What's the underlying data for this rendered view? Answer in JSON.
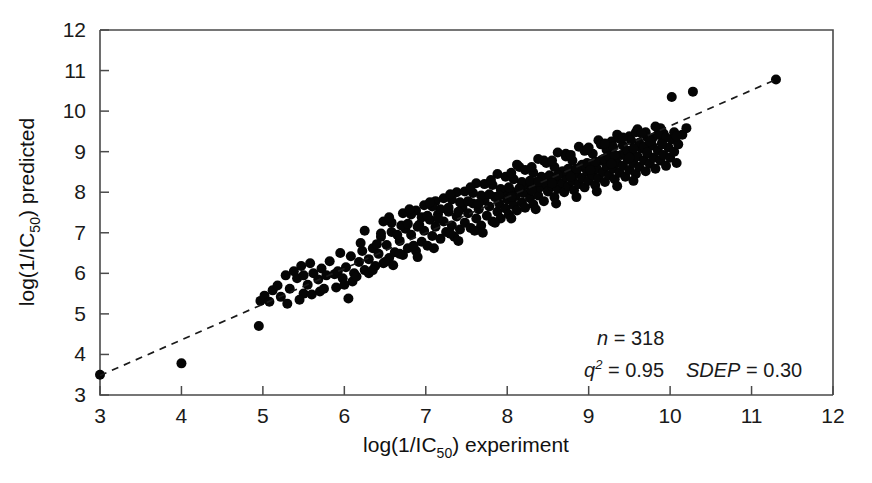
{
  "figure": {
    "background_color": "#ffffff",
    "marker_color": "#050505",
    "axis_color": "#4a4a4a",
    "line_color": "#1a1a1a"
  },
  "chart_data": {
    "type": "scatter",
    "title": "",
    "subtitle": "",
    "xlabel": "log(1/IC50) experiment",
    "ylabel": "log(1/IC50) predicted",
    "xlabel_parts": {
      "prefix": "log(1/IC",
      "subscript": "50",
      "suffix": ") experiment"
    },
    "ylabel_parts": {
      "prefix": "log(1/IC",
      "subscript": "50",
      "suffix": ") predicted"
    },
    "xlim": [
      3,
      12
    ],
    "ylim": [
      3,
      12
    ],
    "xticks": [
      3,
      4,
      5,
      6,
      7,
      8,
      9,
      10,
      11,
      12
    ],
    "yticks": [
      3,
      4,
      5,
      6,
      7,
      8,
      9,
      10,
      11,
      12
    ],
    "xtick_labels": [
      "3",
      "4",
      "5",
      "6",
      "7",
      "8",
      "9",
      "10",
      "11",
      "12"
    ],
    "ytick_labels": [
      "3",
      "4",
      "5",
      "6",
      "7",
      "8",
      "9",
      "10",
      "11",
      "12"
    ],
    "grid": false,
    "legend": null,
    "marker_style": "filled-circle",
    "marker_size_px": 10,
    "annotations": [
      {
        "name": "n",
        "label": "n",
        "operator": "=",
        "value": "318",
        "superscript": ""
      },
      {
        "name": "q2",
        "label": "q",
        "operator": "=",
        "value": "0.95",
        "superscript": "2"
      },
      {
        "name": "sdep",
        "label": "SDEP",
        "operator": "=",
        "value": "0.30",
        "superscript": ""
      }
    ],
    "fit_line": {
      "style": "dashed",
      "x": [
        3.0,
        11.3
      ],
      "y": [
        3.48,
        10.78
      ]
    },
    "n_points": 318,
    "points": [
      [
        3.0,
        3.5
      ],
      [
        4.0,
        3.78
      ],
      [
        4.95,
        4.7
      ],
      [
        4.97,
        5.32
      ],
      [
        5.02,
        5.45
      ],
      [
        5.08,
        5.3
      ],
      [
        5.12,
        5.58
      ],
      [
        5.18,
        5.7
      ],
      [
        5.22,
        5.42
      ],
      [
        5.28,
        5.95
      ],
      [
        5.33,
        5.62
      ],
      [
        5.38,
        6.05
      ],
      [
        5.42,
        5.88
      ],
      [
        5.47,
        6.18
      ],
      [
        5.5,
        5.95
      ],
      [
        5.55,
        5.72
      ],
      [
        5.58,
        6.25
      ],
      [
        5.62,
        6.0
      ],
      [
        5.68,
        5.85
      ],
      [
        5.72,
        6.12
      ],
      [
        5.78,
        5.95
      ],
      [
        5.82,
        6.3
      ],
      [
        5.88,
        5.98
      ],
      [
        5.92,
        6.05
      ],
      [
        5.98,
        5.88
      ],
      [
        6.02,
        6.15
      ],
      [
        6.05,
        5.38
      ],
      [
        6.08,
        6.42
      ],
      [
        6.12,
        6.0
      ],
      [
        6.18,
        6.28
      ],
      [
        6.22,
        6.55
      ],
      [
        6.25,
        6.08
      ],
      [
        6.3,
        6.35
      ],
      [
        6.35,
        6.62
      ],
      [
        6.38,
        6.18
      ],
      [
        6.42,
        6.48
      ],
      [
        6.45,
        6.9
      ],
      [
        6.48,
        6.25
      ],
      [
        6.52,
        6.7
      ],
      [
        6.55,
        6.38
      ],
      [
        6.58,
        7.02
      ],
      [
        6.62,
        6.52
      ],
      [
        6.68,
        6.8
      ],
      [
        6.72,
        6.45
      ],
      [
        6.75,
        7.1
      ],
      [
        6.78,
        6.62
      ],
      [
        6.82,
        6.95
      ],
      [
        6.88,
        6.55
      ],
      [
        6.92,
        7.2
      ],
      [
        6.95,
        6.78
      ],
      [
        6.98,
        7.05
      ],
      [
        7.02,
        6.68
      ],
      [
        7.05,
        7.32
      ],
      [
        7.08,
        6.92
      ],
      [
        7.12,
        7.15
      ],
      [
        7.15,
        7.45
      ],
      [
        7.18,
        6.85
      ],
      [
        7.22,
        7.28
      ],
      [
        7.25,
        7.02
      ],
      [
        7.28,
        7.52
      ],
      [
        7.32,
        7.18
      ],
      [
        7.35,
        6.9
      ],
      [
        7.38,
        7.4
      ],
      [
        7.42,
        7.08
      ],
      [
        7.45,
        7.62
      ],
      [
        7.48,
        7.25
      ],
      [
        7.52,
        7.48
      ],
      [
        7.55,
        7.12
      ],
      [
        7.58,
        7.72
      ],
      [
        7.62,
        7.35
      ],
      [
        7.65,
        7.58
      ],
      [
        7.68,
        7.18
      ],
      [
        7.72,
        7.8
      ],
      [
        7.75,
        7.42
      ],
      [
        7.78,
        7.65
      ],
      [
        7.82,
        7.28
      ],
      [
        7.85,
        7.88
      ],
      [
        7.88,
        7.52
      ],
      [
        7.9,
        7.72
      ],
      [
        7.92,
        7.35
      ],
      [
        7.95,
        7.95
      ],
      [
        7.98,
        7.6
      ],
      [
        8.0,
        7.82
      ],
      [
        8.02,
        7.45
      ],
      [
        8.05,
        8.02
      ],
      [
        8.08,
        7.68
      ],
      [
        8.1,
        7.9
      ],
      [
        8.12,
        7.55
      ],
      [
        8.15,
        8.1
      ],
      [
        8.18,
        7.75
      ],
      [
        8.2,
        7.98
      ],
      [
        8.22,
        7.62
      ],
      [
        8.25,
        8.18
      ],
      [
        8.28,
        7.85
      ],
      [
        8.3,
        8.05
      ],
      [
        8.32,
        7.7
      ],
      [
        8.35,
        8.25
      ],
      [
        8.38,
        7.92
      ],
      [
        8.4,
        8.12
      ],
      [
        8.42,
        8.32
      ],
      [
        8.45,
        7.78
      ],
      [
        8.48,
        8.2
      ],
      [
        8.5,
        8.02
      ],
      [
        8.52,
        8.4
      ],
      [
        8.55,
        8.15
      ],
      [
        8.58,
        7.88
      ],
      [
        8.6,
        8.3
      ],
      [
        8.62,
        8.08
      ],
      [
        8.65,
        8.48
      ],
      [
        8.68,
        8.22
      ],
      [
        8.7,
        8.0
      ],
      [
        8.72,
        8.38
      ],
      [
        8.75,
        8.15
      ],
      [
        8.78,
        8.55
      ],
      [
        8.8,
        8.28
      ],
      [
        8.82,
        8.05
      ],
      [
        8.85,
        8.45
      ],
      [
        8.88,
        8.2
      ],
      [
        8.9,
        8.62
      ],
      [
        8.92,
        8.35
      ],
      [
        8.95,
        8.12
      ],
      [
        8.98,
        8.52
      ],
      [
        9.0,
        8.28
      ],
      [
        9.02,
        8.7
      ],
      [
        9.05,
        8.42
      ],
      [
        9.08,
        8.18
      ],
      [
        9.1,
        8.58
      ],
      [
        9.12,
        8.35
      ],
      [
        9.15,
        8.78
      ],
      [
        9.18,
        8.5
      ],
      [
        9.2,
        8.25
      ],
      [
        9.22,
        8.65
      ],
      [
        9.25,
        8.42
      ],
      [
        9.28,
        8.85
      ],
      [
        9.3,
        8.58
      ],
      [
        9.32,
        8.32
      ],
      [
        9.35,
        8.72
      ],
      [
        9.38,
        8.48
      ],
      [
        9.4,
        8.92
      ],
      [
        9.42,
        8.65
      ],
      [
        9.45,
        8.38
      ],
      [
        9.48,
        8.8
      ],
      [
        9.5,
        8.55
      ],
      [
        9.52,
        9.0
      ],
      [
        9.55,
        8.72
      ],
      [
        9.58,
        8.45
      ],
      [
        9.6,
        8.88
      ],
      [
        9.62,
        8.62
      ],
      [
        9.65,
        9.08
      ],
      [
        9.68,
        8.78
      ],
      [
        9.7,
        8.52
      ],
      [
        9.72,
        8.95
      ],
      [
        9.75,
        8.7
      ],
      [
        9.78,
        9.15
      ],
      [
        9.8,
        8.85
      ],
      [
        9.82,
        8.58
      ],
      [
        9.85,
        9.02
      ],
      [
        9.88,
        8.78
      ],
      [
        9.9,
        9.22
      ],
      [
        9.92,
        8.92
      ],
      [
        9.95,
        8.65
      ],
      [
        9.98,
        9.1
      ],
      [
        10.0,
        8.85
      ],
      [
        10.02,
        9.3
      ],
      [
        10.05,
        9.0
      ],
      [
        10.08,
        8.72
      ],
      [
        10.1,
        9.18
      ],
      [
        10.15,
        9.42
      ],
      [
        10.2,
        9.58
      ],
      [
        10.28,
        10.48
      ],
      [
        10.02,
        10.35
      ],
      [
        11.3,
        10.78
      ],
      [
        7.3,
        6.98
      ],
      [
        7.6,
        7.05
      ],
      [
        7.85,
        7.25
      ],
      [
        8.05,
        7.35
      ],
      [
        8.35,
        7.58
      ],
      [
        8.6,
        7.72
      ],
      [
        8.85,
        7.88
      ],
      [
        9.1,
        8.02
      ],
      [
        9.35,
        8.15
      ],
      [
        9.55,
        8.28
      ],
      [
        6.9,
        6.4
      ],
      [
        7.1,
        6.62
      ],
      [
        7.4,
        6.8
      ],
      [
        7.7,
        7.0
      ],
      [
        6.6,
        6.2
      ],
      [
        6.3,
        6.0
      ],
      [
        6.1,
        5.8
      ],
      [
        5.9,
        5.65
      ],
      [
        5.7,
        5.55
      ],
      [
        5.5,
        5.5
      ],
      [
        8.15,
        8.62
      ],
      [
        8.45,
        8.78
      ],
      [
        8.72,
        8.95
      ],
      [
        9.0,
        9.1
      ],
      [
        9.28,
        9.25
      ],
      [
        9.5,
        9.38
      ],
      [
        9.7,
        9.48
      ],
      [
        9.88,
        9.58
      ],
      [
        9.6,
        9.55
      ],
      [
        9.35,
        9.42
      ],
      [
        9.12,
        9.28
      ],
      [
        8.88,
        9.12
      ],
      [
        8.62,
        8.98
      ],
      [
        8.38,
        8.82
      ],
      [
        8.12,
        8.68
      ],
      [
        7.88,
        8.45
      ],
      [
        7.62,
        8.22
      ],
      [
        7.38,
        8.0
      ],
      [
        7.12,
        7.78
      ],
      [
        6.88,
        7.55
      ],
      [
        9.22,
        9.05
      ],
      [
        9.42,
        9.15
      ],
      [
        9.62,
        9.22
      ],
      [
        9.78,
        9.32
      ],
      [
        9.92,
        9.45
      ],
      [
        9.45,
        8.95
      ],
      [
        9.18,
        8.82
      ],
      [
        8.92,
        8.68
      ],
      [
        8.68,
        8.52
      ],
      [
        8.42,
        8.38
      ],
      [
        8.18,
        8.25
      ],
      [
        7.92,
        8.08
      ],
      [
        7.68,
        7.92
      ],
      [
        7.42,
        7.75
      ],
      [
        7.18,
        7.58
      ],
      [
        6.95,
        7.38
      ],
      [
        6.7,
        7.18
      ],
      [
        6.45,
        6.98
      ],
      [
        6.2,
        6.75
      ],
      [
        5.95,
        6.5
      ],
      [
        9.05,
        8.95
      ],
      [
        9.3,
        9.12
      ],
      [
        9.52,
        9.28
      ],
      [
        9.72,
        9.35
      ],
      [
        9.85,
        9.42
      ],
      [
        8.8,
        8.78
      ],
      [
        8.58,
        8.62
      ],
      [
        8.32,
        8.48
      ],
      [
        8.08,
        8.32
      ],
      [
        7.82,
        8.18
      ],
      [
        7.58,
        7.98
      ],
      [
        7.32,
        7.82
      ],
      [
        7.08,
        7.65
      ],
      [
        6.82,
        7.45
      ],
      [
        6.58,
        7.25
      ],
      [
        9.95,
        9.35
      ],
      [
        10.05,
        9.48
      ],
      [
        9.68,
        9.12
      ],
      [
        9.48,
        9.02
      ],
      [
        9.25,
        8.88
      ],
      [
        8.98,
        8.72
      ],
      [
        8.75,
        8.58
      ],
      [
        8.52,
        8.42
      ],
      [
        8.28,
        8.28
      ],
      [
        8.02,
        8.12
      ],
      [
        7.78,
        7.95
      ],
      [
        7.52,
        7.78
      ],
      [
        7.28,
        7.62
      ],
      [
        7.02,
        7.42
      ],
      [
        6.78,
        7.22
      ],
      [
        9.58,
        9.48
      ],
      [
        9.38,
        9.32
      ],
      [
        9.15,
        9.18
      ],
      [
        8.95,
        9.02
      ],
      [
        8.72,
        8.88
      ],
      [
        8.48,
        8.72
      ],
      [
        8.22,
        8.55
      ],
      [
        7.98,
        8.38
      ],
      [
        7.72,
        8.2
      ],
      [
        7.48,
        8.02
      ],
      [
        7.22,
        7.85
      ],
      [
        6.98,
        7.68
      ],
      [
        6.72,
        7.48
      ],
      [
        6.48,
        7.28
      ],
      [
        6.25,
        7.05
      ],
      [
        9.75,
        9.25
      ],
      [
        9.55,
        9.08
      ],
      [
        9.32,
        8.92
      ],
      [
        9.08,
        8.75
      ],
      [
        8.85,
        8.58
      ],
      [
        8.62,
        8.42
      ],
      [
        8.38,
        8.25
      ],
      [
        8.15,
        8.08
      ],
      [
        7.9,
        7.92
      ],
      [
        7.65,
        7.72
      ],
      [
        7.4,
        7.52
      ],
      [
        7.15,
        7.35
      ],
      [
        6.9,
        7.15
      ],
      [
        6.65,
        6.95
      ],
      [
        6.4,
        6.72
      ],
      [
        9.82,
        9.62
      ],
      [
        9.65,
        9.45
      ],
      [
        9.42,
        9.35
      ],
      [
        9.2,
        9.2
      ],
      [
        8.98,
        9.05
      ],
      [
        8.78,
        8.92
      ],
      [
        8.55,
        8.78
      ],
      [
        8.3,
        8.62
      ],
      [
        8.05,
        8.48
      ],
      [
        7.8,
        8.3
      ],
      [
        7.55,
        8.12
      ],
      [
        7.3,
        7.95
      ],
      [
        7.05,
        7.75
      ],
      [
        6.8,
        7.58
      ],
      [
        6.55,
        7.38
      ],
      [
        9.9,
        9.18
      ],
      [
        10.08,
        9.38
      ],
      [
        9.72,
        8.98
      ],
      [
        9.5,
        8.85
      ],
      [
        9.28,
        8.7
      ],
      [
        9.02,
        8.55
      ],
      [
        8.78,
        8.38
      ],
      [
        8.55,
        8.22
      ],
      [
        8.3,
        8.05
      ],
      [
        8.05,
        7.88
      ],
      [
        5.3,
        5.25
      ],
      [
        5.45,
        5.35
      ],
      [
        5.6,
        5.48
      ],
      [
        5.75,
        5.62
      ],
      [
        6.0,
        5.72
      ],
      [
        6.15,
        5.92
      ],
      [
        6.35,
        6.08
      ],
      [
        6.5,
        6.28
      ],
      [
        6.68,
        6.48
      ],
      [
        6.85,
        6.68
      ]
    ]
  }
}
